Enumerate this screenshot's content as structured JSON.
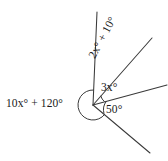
{
  "figure": {
    "background_color": "#ffffff",
    "stroke_color": "#3a3a3a",
    "text_color": "#1a1a1a",
    "vertex": {
      "x": 93,
      "y": 105
    },
    "rays": [
      {
        "name": "ray-steep-up",
        "x2": 97,
        "y2": 12,
        "angle_deg": 87
      },
      {
        "name": "ray-diagonal-up",
        "x2": 152,
        "y2": 38,
        "angle_deg": 50
      },
      {
        "name": "ray-right",
        "x2": 167,
        "y2": 85,
        "angle_deg": 16
      },
      {
        "name": "ray-lower-right",
        "x2": 150,
        "y2": 153,
        "angle_deg": -38
      }
    ],
    "arcs": [
      {
        "name": "reflex-angle-arc",
        "radius": 15
      },
      {
        "name": "three-x-arc",
        "radius": 12
      },
      {
        "name": "fifty-arc",
        "radius": 14
      }
    ]
  },
  "labels": {
    "reflex": "10x° + 120°",
    "two_x_plus_ten": "2x° + 10°",
    "three_x": "3x°",
    "fifty": "50°"
  }
}
